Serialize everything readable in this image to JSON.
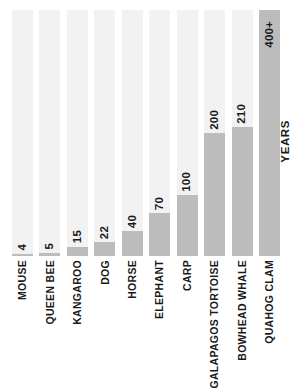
{
  "chart_data": {
    "type": "bar",
    "title": "",
    "xlabel": "",
    "ylabel": "YEARS",
    "grid": false,
    "legend": null,
    "orientation": "vertical",
    "ylim": [
      0,
      400
    ],
    "categories": [
      "MOUSE",
      "QUEEN BEE",
      "KANGAROO",
      "DOG",
      "HORSE",
      "ELEPHANT",
      "CARP",
      "GALAPAGOS TORTOISE",
      "BOWHEAD WHALE",
      "QUAHOG CLAM"
    ],
    "values": [
      4,
      5,
      15,
      22,
      40,
      70,
      100,
      200,
      210,
      400
    ],
    "value_labels": [
      "4",
      "5",
      "15",
      "22",
      "40",
      "70",
      "100",
      "200",
      "210",
      "400+"
    ],
    "bars": [
      {
        "category": "MOUSE",
        "value": 4,
        "label": "4",
        "pct": 1.0,
        "label_inside": false
      },
      {
        "category": "QUEEN BEE",
        "value": 5,
        "label": "5",
        "pct": 1.3,
        "label_inside": false
      },
      {
        "category": "KANGAROO",
        "value": 15,
        "label": "15",
        "pct": 3.8,
        "label_inside": false
      },
      {
        "category": "DOG",
        "value": 22,
        "label": "22",
        "pct": 5.5,
        "label_inside": false
      },
      {
        "category": "HORSE",
        "value": 40,
        "label": "40",
        "pct": 10.0,
        "label_inside": false
      },
      {
        "category": "ELEPHANT",
        "value": 70,
        "label": "70",
        "pct": 17.5,
        "label_inside": false
      },
      {
        "category": "CARP",
        "value": 100,
        "label": "100",
        "pct": 25.0,
        "label_inside": false
      },
      {
        "category": "GALAPAGOS TORTOISE",
        "value": 200,
        "label": "200",
        "pct": 50.0,
        "label_inside": false
      },
      {
        "category": "BOWHEAD WHALE",
        "value": 210,
        "label": "210",
        "pct": 52.5,
        "label_inside": false
      },
      {
        "category": "QUAHOG CLAM",
        "value": 400,
        "label": "400+",
        "pct": 100.0,
        "label_inside": true
      }
    ],
    "colors": {
      "bar_fill": "#bcbcbc",
      "bar_track": "#f2f2f2",
      "text": "#1a1a1a",
      "background": "#ffffff"
    }
  }
}
